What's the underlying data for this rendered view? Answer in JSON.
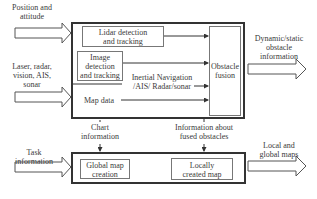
{
  "inputs": {
    "position": "Position and attitude",
    "position_lines": [
      "Position and",
      "attitude"
    ],
    "sensors_lines": [
      "Laser, radar,",
      "vision, AIS,",
      "sonar"
    ],
    "task_lines": [
      "Task",
      "information"
    ]
  },
  "top_module": {
    "lidar_lines": [
      "Lidar detection",
      "and tracking"
    ],
    "image_lines": [
      "Image",
      "detection",
      "and tracking"
    ],
    "inertial_lines": [
      "Inertial Navigation",
      "/AIS/ Radar/sonar"
    ],
    "map_data": "Map data",
    "fusion_lines": [
      "Obstacle",
      "fusion"
    ]
  },
  "links": {
    "chart_lines": [
      "Chart",
      "information"
    ],
    "fused_lines": [
      "Information about",
      "fused obstacles"
    ]
  },
  "bottom_module": {
    "global_lines": [
      "Global map",
      "creation"
    ],
    "local_lines": [
      "Locally",
      "created map"
    ]
  },
  "outputs": {
    "dynamic_lines": [
      "Dynamic/static",
      "obstacle",
      "information"
    ],
    "maps_lines": [
      "Local and",
      "global maps"
    ]
  }
}
